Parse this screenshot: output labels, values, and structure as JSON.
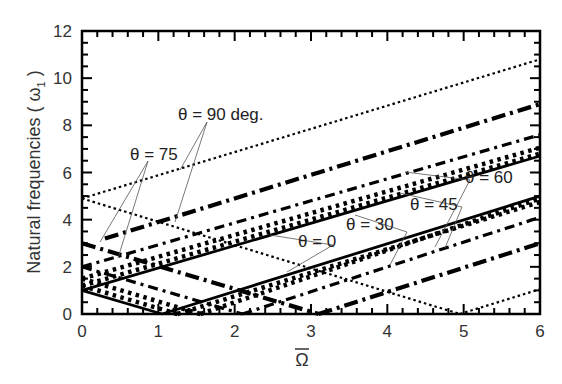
{
  "chart_data": {
    "type": "line",
    "title": "",
    "xlabel": "Ω̄",
    "ylabel": "Natural frequencies ( ω̄₁ )",
    "xlim": [
      0,
      6
    ],
    "ylim": [
      0,
      12
    ],
    "xticks": [
      "0",
      "1",
      "2",
      "3",
      "4",
      "5",
      "6"
    ],
    "yticks": [
      "0",
      "2",
      "4",
      "6",
      "8",
      "10",
      "12"
    ],
    "grid": false,
    "legend": "inline annotations",
    "series": [
      {
        "name": "θ = 90 deg.",
        "style": "dotted-thin",
        "segments": [
          {
            "x": [
              0,
              6
            ],
            "y": [
              4.9,
              10.8
            ]
          },
          {
            "x": [
              0,
              4.95
            ],
            "y": [
              4.9,
              0
            ]
          },
          {
            "x": [
              4.95,
              6
            ],
            "y": [
              0,
              1.05
            ]
          }
        ]
      },
      {
        "name": "θ = 75",
        "style": "dash-dot-heavy",
        "segments": [
          {
            "x": [
              0.3,
              6
            ],
            "y": [
              3.2,
              8.9
            ]
          },
          {
            "x": [
              0,
              3.1
            ],
            "y": [
              3.0,
              0
            ]
          },
          {
            "x": [
              3.1,
              6
            ],
            "y": [
              0,
              3.0
            ]
          }
        ]
      },
      {
        "name": "θ = 60",
        "style": "dash-dot",
        "segments": [
          {
            "x": [
              0,
              6
            ],
            "y": [
              2.0,
              7.6
            ]
          },
          {
            "x": [
              0,
              2.1
            ],
            "y": [
              2.0,
              0
            ]
          },
          {
            "x": [
              2.1,
              6
            ],
            "y": [
              0,
              4.1
            ]
          }
        ]
      },
      {
        "name": "θ = 45",
        "style": "dotted-heavy",
        "segments": [
          {
            "x": [
              0,
              6
            ],
            "y": [
              1.5,
              7.05
            ]
          },
          {
            "x": [
              0,
              1.55
            ],
            "y": [
              1.5,
              0
            ]
          },
          {
            "x": [
              1.55,
              6
            ],
            "y": [
              0,
              4.9
            ]
          }
        ]
      },
      {
        "name": "θ = 30",
        "style": "dotted-heavy",
        "segments": [
          {
            "x": [
              0,
              6
            ],
            "y": [
              1.2,
              6.8
            ]
          },
          {
            "x": [
              0,
              1.25
            ],
            "y": [
              1.2,
              0
            ]
          },
          {
            "x": [
              1.25,
              6
            ],
            "y": [
              0,
              4.75
            ]
          }
        ]
      },
      {
        "name": "θ = 0",
        "style": "solid",
        "segments": [
          {
            "x": [
              0,
              6
            ],
            "y": [
              1.0,
              6.7
            ]
          },
          {
            "x": [
              0,
              1.05
            ],
            "y": [
              1.0,
              0
            ]
          },
          {
            "x": [
              1.05,
              6
            ],
            "y": [
              0,
              5.0
            ]
          }
        ]
      }
    ],
    "annotations": [
      {
        "text": "θ = 90 deg.",
        "x": 2.05,
        "y": 8.0
      },
      {
        "text": "θ = 75",
        "x": 0.75,
        "y": 7.2
      },
      {
        "text": "θ = 60",
        "x": 4.95,
        "y": 6.2
      },
      {
        "text": "θ = 45",
        "x": 3.95,
        "y": 5.0
      },
      {
        "text": "θ = 30",
        "x": 3.15,
        "y": 4.2
      },
      {
        "text": "θ = 0",
        "x": 2.35,
        "y": 3.3
      }
    ]
  },
  "axes": {
    "x_title": "Ω",
    "y_title": "Natural frequencies ( ω",
    "y_title_sub": "1",
    "y_title_close": " )"
  },
  "labels": {
    "t90": "θ = 90 deg.",
    "t75": "θ = 75",
    "t60": "θ = 60",
    "t45": "θ = 45",
    "t30": "θ = 30",
    "t0": "θ = 0"
  }
}
